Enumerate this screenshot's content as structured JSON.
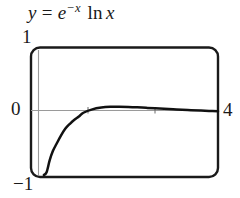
{
  "figure": {
    "title_parts": {
      "y": "y",
      "equals": "=",
      "base": "e",
      "exponent": "−x",
      "function": "ln",
      "argument": "x"
    },
    "title_text": "y = e^(-x) ln x"
  },
  "labels": {
    "y_max": "1",
    "y_zero": "0",
    "y_min": "−1",
    "x_max": "4"
  },
  "colors": {
    "curve": "#111111",
    "frame": "#1a1a1a",
    "axis": "#9a9a9a",
    "background": "#ffffff",
    "text": "#1a1a1a"
  },
  "chart_data": {
    "type": "line",
    "xlabel": "",
    "ylabel": "",
    "xlim": [
      0,
      4
    ],
    "ylim": [
      -1,
      1
    ],
    "grid": false,
    "legend": null,
    "tick_labels": {
      "x": [
        "0",
        "4"
      ],
      "y": [
        "-1",
        "0",
        "1"
      ]
    },
    "axis_ticks_on_zero_line": [
      1,
      2
    ],
    "series": [
      {
        "name": "y = e^(-x) ln x",
        "x": [
          0.12,
          0.18,
          0.25,
          0.32,
          0.4,
          0.5,
          0.6,
          0.7,
          0.8,
          0.9,
          1.0,
          1.2,
          1.4,
          1.6,
          1.8,
          2.0,
          2.2,
          2.4,
          2.6,
          2.8,
          3.0,
          3.2,
          3.4,
          3.6,
          3.8,
          4.0
        ],
        "y": [
          -1.0,
          -0.957,
          -0.762,
          -0.616,
          -0.502,
          -0.367,
          -0.255,
          -0.177,
          -0.111,
          -0.061,
          0.0,
          0.055,
          0.083,
          0.095,
          0.097,
          0.094,
          0.088,
          0.079,
          0.071,
          0.063,
          0.055,
          0.047,
          0.041,
          0.035,
          0.03,
          0.025
        ]
      }
    ],
    "annotations": [
      {
        "text": "1",
        "position": "top-left-of-frame"
      },
      {
        "text": "0",
        "position": "left-at-y=0"
      },
      {
        "text": "-1",
        "position": "bottom-left-of-frame"
      },
      {
        "text": "4",
        "position": "right-at-y=0"
      }
    ]
  }
}
